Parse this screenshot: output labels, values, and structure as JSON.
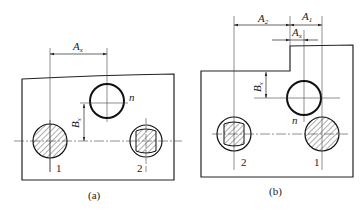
{
  "figure_a": {
    "caption": "(a)",
    "dim_horizontal": "A",
    "dim_horizontal_sub": "x",
    "dim_vertical": "B",
    "dim_vertical_sub": "x",
    "hole_label": "n",
    "pin1_label": "1",
    "pin2_label": "2"
  },
  "figure_b": {
    "caption": "(b)",
    "dim_left": "A",
    "dim_left_sub": "2",
    "dim_right": "A",
    "dim_right_sub": "1",
    "dim_small": "A",
    "dim_small_sub": "x",
    "dim_vertical": "B",
    "dim_vertical_sub": "x",
    "hole_label": "n",
    "pin1_label": "1",
    "pin2_label": "2"
  }
}
